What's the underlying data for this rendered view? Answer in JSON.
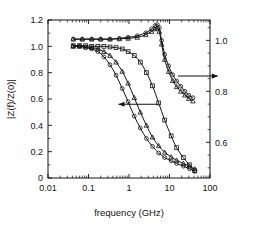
{
  "chart_data": {
    "type": "line",
    "title": "",
    "xlabel": "frequency (GHz)",
    "ylabel": "|Z(f)/Z(0)|",
    "ylabel_right": "",
    "xscale": "log",
    "xlim": [
      0.01,
      100
    ],
    "ylim": [
      0,
      1.2
    ],
    "ylim_right": [
      0.46,
      1.08
    ],
    "grid": false,
    "legend": false,
    "xticks": [
      "0.01",
      "0.1",
      "1",
      "10",
      "100"
    ],
    "xtick_values": [
      0.01,
      0.1,
      1,
      10,
      100
    ],
    "yticks": [
      "0",
      "0.2",
      "0.4",
      "0.6",
      "0.8",
      "1.0",
      "1.2"
    ],
    "ytick_values": [
      0,
      0.2,
      0.4,
      0.6,
      0.8,
      1.0,
      1.2
    ],
    "yticks_right": [
      "0.6",
      "0.8",
      "1.0"
    ],
    "ytick_values_right": [
      0.6,
      0.8,
      1.0
    ],
    "annotations": [
      {
        "name": "left-axis-arrow",
        "text": "",
        "points_to": "left",
        "x": 0.55,
        "y": 0.56
      },
      {
        "name": "right-axis-arrow",
        "text": "",
        "points_to": "right",
        "x": 18.0,
        "y": 0.86
      }
    ],
    "series": [
      {
        "name": "left-curve-a",
        "axis": "left",
        "marker": "circle",
        "x": [
          0.042,
          0.06,
          0.085,
          0.12,
          0.17,
          0.24,
          0.34,
          0.48,
          0.68,
          0.95,
          1.35,
          1.9,
          2.7,
          3.8,
          5.4,
          7.6,
          11,
          15,
          22,
          31,
          42
        ],
        "y": [
          1.0,
          1.0,
          0.99,
          0.98,
          0.96,
          0.92,
          0.86,
          0.78,
          0.68,
          0.58,
          0.47,
          0.38,
          0.3,
          0.24,
          0.19,
          0.155,
          0.13,
          0.11,
          0.09,
          0.07,
          0.05
        ]
      },
      {
        "name": "left-curve-b",
        "axis": "left",
        "marker": "triangle",
        "x": [
          0.042,
          0.06,
          0.085,
          0.12,
          0.17,
          0.24,
          0.34,
          0.48,
          0.68,
          0.95,
          1.35,
          1.9,
          2.7,
          3.8,
          5.4,
          7.6,
          11,
          15,
          22,
          31,
          42
        ],
        "y": [
          1.0,
          1.0,
          0.995,
          0.99,
          0.98,
          0.96,
          0.93,
          0.88,
          0.81,
          0.72,
          0.61,
          0.5,
          0.4,
          0.31,
          0.245,
          0.195,
          0.16,
          0.135,
          0.11,
          0.09,
          0.07
        ]
      },
      {
        "name": "left-curve-c",
        "axis": "left",
        "marker": "square",
        "x": [
          0.042,
          0.06,
          0.085,
          0.12,
          0.17,
          0.24,
          0.34,
          0.48,
          0.68,
          0.95,
          1.35,
          1.9,
          2.7,
          3.8,
          5.4,
          7.6,
          11,
          15,
          22,
          31,
          42
        ],
        "y": [
          1.005,
          1.005,
          1.005,
          1.0,
          1.0,
          1.0,
          0.995,
          0.99,
          0.98,
          0.96,
          0.93,
          0.88,
          0.8,
          0.7,
          0.57,
          0.44,
          0.32,
          0.23,
          0.155,
          0.1,
          0.055
        ]
      },
      {
        "name": "right-curve-a",
        "axis": "right",
        "marker": "circle",
        "x": [
          0.042,
          0.07,
          0.12,
          0.2,
          0.34,
          0.58,
          0.95,
          1.6,
          2.6,
          3.6,
          4.4,
          5.0,
          5.6,
          6.4,
          7.6,
          9.5,
          12,
          15,
          19,
          24,
          30,
          38
        ],
        "y": [
          1.005,
          1.005,
          1.005,
          1.005,
          1.005,
          1.008,
          1.012,
          1.018,
          1.03,
          1.045,
          1.058,
          1.062,
          1.05,
          1.0,
          0.945,
          0.9,
          0.865,
          0.84,
          0.82,
          0.8,
          0.785,
          0.775
        ]
      },
      {
        "name": "right-curve-b",
        "axis": "right",
        "marker": "triangle",
        "x": [
          0.042,
          0.07,
          0.12,
          0.2,
          0.34,
          0.58,
          0.95,
          1.6,
          2.6,
          3.6,
          4.4,
          5.0,
          5.6,
          6.4,
          7.6,
          9.5,
          12,
          15,
          19,
          24,
          30,
          38
        ],
        "y": [
          1.005,
          1.005,
          1.005,
          1.005,
          1.005,
          1.006,
          1.008,
          1.012,
          1.022,
          1.035,
          1.045,
          1.048,
          1.035,
          0.985,
          0.925,
          0.878,
          0.842,
          0.818,
          0.8,
          0.785,
          0.772,
          0.762
        ]
      }
    ]
  }
}
